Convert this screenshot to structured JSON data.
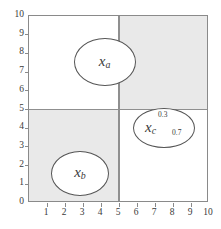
{
  "figure": {
    "kind": "partition-diagram",
    "background": "#ffffff",
    "frame_color": "#8a8a8a",
    "shade_color": "#e9e9e9",
    "partition_line_color": "#8f8f8f",
    "ellipse_stroke": "#555555",
    "ellipse_fill": "#ffffff"
  },
  "axes": {
    "x": {
      "label": "",
      "min": 0,
      "max": 10,
      "ticks": [
        0,
        1,
        2,
        3,
        4,
        5,
        6,
        7,
        8,
        9,
        10
      ],
      "tick_labels": [
        "",
        "1",
        "2",
        "3",
        "4",
        "5",
        "6",
        "7",
        "8",
        "9",
        "10"
      ]
    },
    "y": {
      "label": "",
      "min": 0,
      "max": 10,
      "ticks": [
        0,
        1,
        2,
        3,
        4,
        5,
        6,
        7,
        8,
        9,
        10
      ],
      "tick_labels": [
        "0",
        "1",
        "2",
        "3",
        "4",
        "5",
        "6",
        "7",
        "8",
        "9",
        "10"
      ]
    }
  },
  "chart_data": {
    "type": "scatter",
    "title": "",
    "xlabel": "",
    "ylabel": "",
    "xlim": [
      0,
      10
    ],
    "ylim": [
      0,
      10
    ],
    "grid": false,
    "legend": "none",
    "partition_lines": {
      "vertical_x": 5,
      "horizontal_y": 5
    },
    "shaded_regions": [
      {
        "name": "top-right",
        "x": [
          5,
          10
        ],
        "y": [
          5,
          10
        ],
        "color": "#e9e9e9"
      },
      {
        "name": "bottom-left",
        "x": [
          0,
          5
        ],
        "y": [
          0,
          5
        ],
        "color": "#e9e9e9"
      }
    ],
    "objects": [
      {
        "id": "x_a",
        "label": "x",
        "subscript": "a",
        "center": [
          4.2,
          7.55
        ],
        "rx": 1.72,
        "ry": 1.28,
        "fill": "#ffffff",
        "annotations": []
      },
      {
        "id": "x_b",
        "label": "x",
        "subscript": "b",
        "center": [
          2.83,
          1.59
        ],
        "rx": 1.61,
        "ry": 1.2,
        "fill": "#ffffff",
        "annotations": []
      },
      {
        "id": "x_c",
        "label": "x",
        "subscript": "c",
        "center": [
          7.5,
          4.0
        ],
        "rx": 1.72,
        "ry": 1.07,
        "fill": "#ffffff",
        "annotations": [
          {
            "text": "0.3",
            "position": "above-partition-line"
          },
          {
            "text": "0.7",
            "position": "below-partition-line"
          }
        ]
      }
    ]
  },
  "labels": {
    "x_a": {
      "base": "x",
      "sub": "a"
    },
    "x_b": {
      "base": "x",
      "sub": "b"
    },
    "x_c": {
      "base": "x",
      "sub": "c"
    },
    "prob_upper": "0.3",
    "prob_lower": "0.7"
  }
}
